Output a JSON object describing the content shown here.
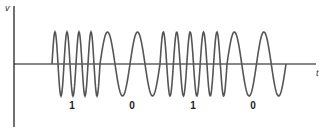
{
  "figure": {
    "title": "",
    "y_axis_label": "v",
    "x_axis_label": "t",
    "colors": {
      "axis": "#111111",
      "signal": "#555555",
      "background": "#ffffff"
    }
  },
  "bits": [
    {
      "label": "1",
      "x_center": 72
    },
    {
      "label": "0",
      "x_center": 132
    },
    {
      "label": "1",
      "x_center": 193
    },
    {
      "label": "0",
      "x_center": 253
    }
  ],
  "chart_data": {
    "type": "line",
    "xlabel": "t",
    "ylabel": "v",
    "grid": false,
    "legend": null,
    "bit_sequence": [
      "1",
      "0",
      "1",
      "0"
    ],
    "segments": [
      {
        "bit": "1",
        "x_start": 52,
        "x_end": 100,
        "cycles": 4,
        "frequency": "high"
      },
      {
        "bit": "0",
        "x_start": 100,
        "x_end": 160,
        "cycles": 2,
        "frequency": "low"
      },
      {
        "bit": "1",
        "x_start": 160,
        "x_end": 227,
        "cycles": 5,
        "frequency": "high"
      },
      {
        "bit": "0",
        "x_start": 227,
        "x_end": 286,
        "cycles": 2,
        "frequency": "low"
      }
    ],
    "amplitude_px": 32,
    "baseline_y_px": 64,
    "annotations": [
      "1",
      "0",
      "1",
      "0"
    ]
  }
}
